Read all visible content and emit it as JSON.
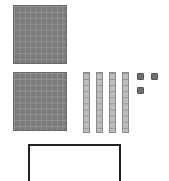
{
  "diagram": {
    "type": "base-ten-blocks",
    "hundreds": 2,
    "tens": 4,
    "ones": 3,
    "colors": {
      "flat": "#7b7b7b",
      "rod": "#bdbdbd",
      "unit": "#6e6e6e",
      "box_border": "#222222"
    },
    "answer_box": {
      "value": ""
    }
  }
}
